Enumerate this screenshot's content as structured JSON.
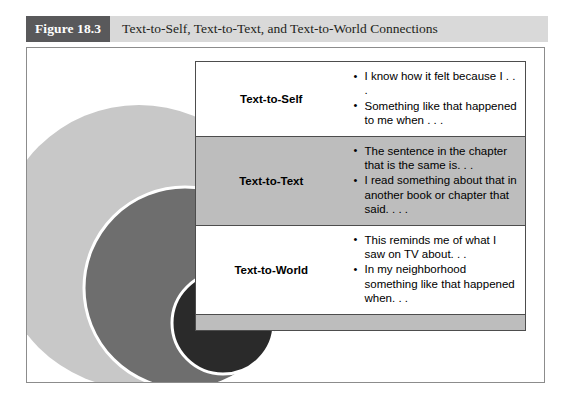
{
  "header": {
    "figure_number": "Figure 18.3",
    "title": "Text-to-Self, Text-to-Text, and Text-to-World Connections"
  },
  "colors": {
    "header_band": "#d9d9d9",
    "figure_number_block": "#59595b",
    "outer_circle": "#c8c8c8",
    "middle_circle": "#6e6e6e",
    "inner_circle": "#2a2a2a",
    "shaded_row": "#bdbdbd",
    "border": "#4d4d4d"
  },
  "diagram": {
    "type": "nested-circles",
    "circles": [
      {
        "name": "text-to-self-circle",
        "fill": "#c8c8c8"
      },
      {
        "name": "text-to-text-circle",
        "fill": "#6e6e6e"
      },
      {
        "name": "text-to-world-circle",
        "fill": "#2a2a2a"
      }
    ]
  },
  "table": {
    "rows": [
      {
        "label": "Text-to-Self",
        "shaded": false,
        "bullets": [
          "I know how it felt because I . . .",
          "Something like that happened to me when . . ."
        ]
      },
      {
        "label": "Text-to-Text",
        "shaded": true,
        "bullets": [
          "The sentence in the chapter that is the same is. . .",
          "I read something about that in another book or chapter that said. . . ."
        ]
      },
      {
        "label": "Text-to-World",
        "shaded": false,
        "bullets": [
          "This reminds me of what I saw on TV about. . .",
          "In my neighborhood something like that happened when. . ."
        ]
      }
    ]
  }
}
